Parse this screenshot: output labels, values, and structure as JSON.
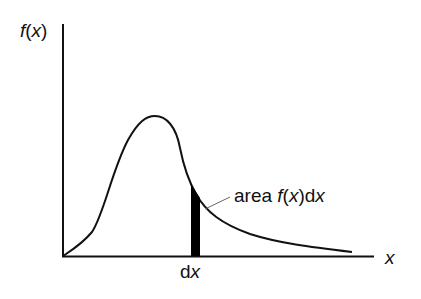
{
  "diagram": {
    "type": "probability-density-curve",
    "y_axis_label": {
      "func": "f",
      "open": "(",
      "var": "x",
      "close": ")"
    },
    "x_axis_label": "x",
    "interval_label": {
      "d": "d",
      "var": "x"
    },
    "annotation": {
      "prefix": "area ",
      "func": "f",
      "open": "(",
      "var": "x",
      "close": ")",
      "d": "d",
      "var2": "x"
    },
    "colors": {
      "line": "#111111",
      "strip_fill": "#000000",
      "leader": "#666666",
      "background": "#ffffff"
    }
  }
}
